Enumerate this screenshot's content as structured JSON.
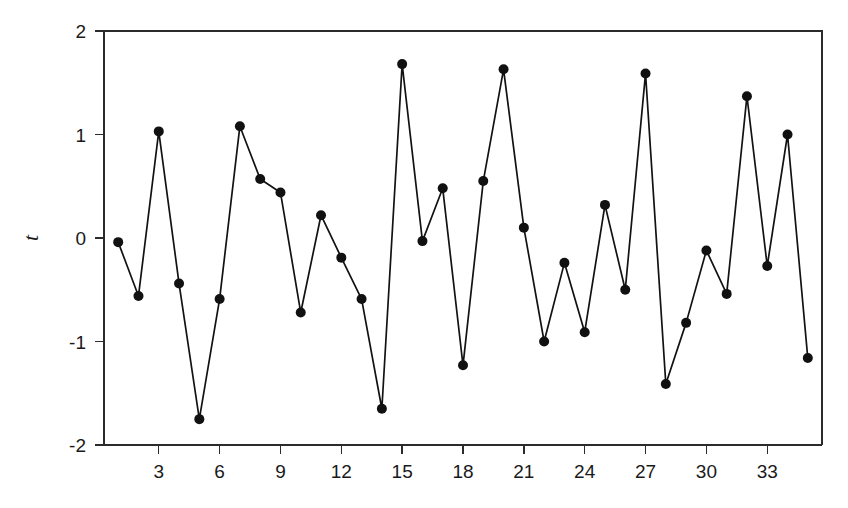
{
  "chart_data": {
    "type": "line",
    "title": "",
    "subtitle": "",
    "xlabel": "",
    "ylabel": "t",
    "ylabel_style": "italic",
    "grid": false,
    "legend": null,
    "markers": "filled-circle",
    "line_color": "#111111",
    "marker_color": "#111111",
    "background_color": "#ffffff",
    "axis_color": "#2b2b2b",
    "xlim": [
      0.3,
      35.7
    ],
    "ylim": [
      -2,
      2
    ],
    "xticks": [
      3,
      6,
      9,
      12,
      15,
      18,
      21,
      24,
      27,
      30,
      33
    ],
    "xtick_labels": [
      "3",
      "6",
      "9",
      "12",
      "15",
      "18",
      "21",
      "24",
      "27",
      "30",
      "33"
    ],
    "yticks": [
      2,
      1,
      0,
      -1,
      -2
    ],
    "ytick_labels": [
      "2",
      "1",
      "0",
      "-1",
      "-2"
    ],
    "x": [
      1,
      2,
      3,
      4,
      5,
      6,
      7,
      8,
      9,
      10,
      11,
      12,
      13,
      14,
      15,
      16,
      17,
      18,
      19,
      20,
      21,
      22,
      23,
      24,
      25,
      26,
      27,
      28,
      29,
      30,
      31,
      32,
      33,
      34,
      35
    ],
    "values": [
      -0.04,
      -0.56,
      1.03,
      -0.44,
      -1.75,
      -0.59,
      1.08,
      0.57,
      0.44,
      -0.72,
      0.22,
      -0.19,
      -0.59,
      -1.65,
      1.68,
      -0.03,
      0.48,
      -1.23,
      0.55,
      1.63,
      0.1,
      -1.0,
      -0.24,
      -0.91,
      0.32,
      -0.5,
      1.59,
      -1.41,
      -0.82,
      -0.12,
      -0.54,
      1.37,
      -0.27,
      1.0,
      -1.16
    ]
  }
}
